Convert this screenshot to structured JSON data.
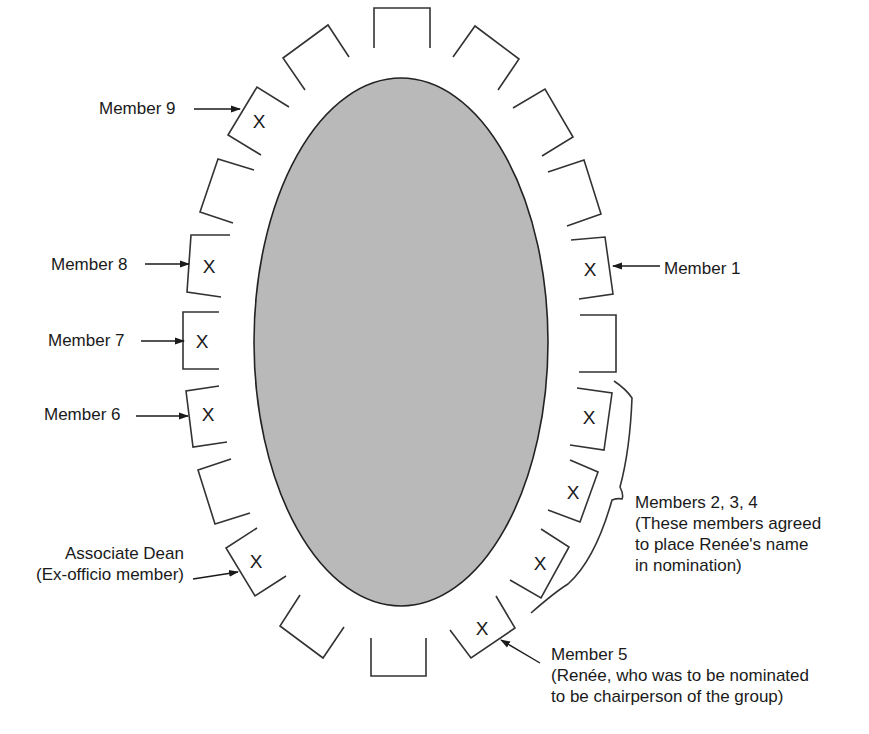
{
  "diagram": {
    "title": "",
    "table": {
      "shape": "ellipse",
      "fill": "#b8b8b8",
      "stroke": "#222222"
    },
    "seat_mark": "X",
    "chairs": [
      {
        "id": "c1",
        "occupied": false
      },
      {
        "id": "c2",
        "occupied": false
      },
      {
        "id": "c3",
        "occupied": false
      },
      {
        "id": "c4",
        "occupied": false
      },
      {
        "id": "member-1",
        "occupied": true
      },
      {
        "id": "c6",
        "occupied": false
      },
      {
        "id": "member-2",
        "occupied": true
      },
      {
        "id": "member-3",
        "occupied": true
      },
      {
        "id": "member-4",
        "occupied": true
      },
      {
        "id": "member-5",
        "occupied": true
      },
      {
        "id": "c11",
        "occupied": false
      },
      {
        "id": "c12",
        "occupied": false
      },
      {
        "id": "associate-dean",
        "occupied": true
      },
      {
        "id": "c14",
        "occupied": false
      },
      {
        "id": "member-6",
        "occupied": true
      },
      {
        "id": "member-7",
        "occupied": true
      },
      {
        "id": "member-8",
        "occupied": true
      },
      {
        "id": "c18",
        "occupied": false
      },
      {
        "id": "member-9",
        "occupied": true
      },
      {
        "id": "c20",
        "occupied": false
      }
    ],
    "labels": {
      "member_1": "Member 1",
      "member_5_line1": "Member 5",
      "member_5_line2": "(Renée, who was to be nominated",
      "member_5_line3": "to be chairperson of the group)",
      "members_234_line1": "Members 2, 3, 4",
      "members_234_line2": "(These members agreed",
      "members_234_line3": "to place Renée's name",
      "members_234_line4": "in nomination)",
      "member_6": "Member 6",
      "member_7": "Member 7",
      "member_8": "Member 8",
      "member_9": "Member 9",
      "associate_dean_line1": "Associate Dean",
      "associate_dean_line2": "(Ex-officio member)"
    }
  }
}
